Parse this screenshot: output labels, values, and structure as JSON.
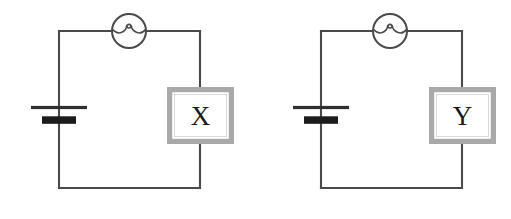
{
  "figure": {
    "background_color": "#ffffff",
    "wire_color": "#4a4a4a",
    "box_border_color": "#a9a9a9",
    "box_fill_color": "#ffffff",
    "label_color": "#1a1a1a",
    "battery_plate_color": "#1c1c1c"
  },
  "circuits": [
    {
      "id": "circuit-left",
      "name": "left-circuit",
      "component_label": "X",
      "component_name": "unknown-component-x",
      "lamp_name": "lamp",
      "battery_name": "battery-cell",
      "loop": {
        "x1": 59,
        "y1": 31,
        "x2": 200,
        "y2": 188
      },
      "lamp": {
        "cx": 129,
        "cy": 31,
        "r": 17
      },
      "battery": {
        "cx": 59,
        "long_plate_y": 107.5,
        "long_plate_half_width": 28,
        "long_plate_thickness": 3.2,
        "short_plate_y": 120,
        "short_plate_half_width": 17,
        "short_plate_thickness": 7.5
      },
      "box": {
        "x": 167,
        "y": 87,
        "w": 67,
        "h": 57
      }
    },
    {
      "id": "circuit-right",
      "name": "right-circuit",
      "component_label": "Y",
      "component_name": "unknown-component-y",
      "lamp_name": "lamp",
      "battery_name": "battery-cell",
      "loop": {
        "x1": 321,
        "y1": 31,
        "x2": 462,
        "y2": 188
      },
      "lamp": {
        "cx": 390,
        "cy": 31,
        "r": 17
      },
      "battery": {
        "cx": 321,
        "long_plate_y": 107.5,
        "long_plate_half_width": 28,
        "long_plate_thickness": 3.2,
        "short_plate_y": 120,
        "short_plate_half_width": 17,
        "short_plate_thickness": 7.5
      },
      "box": {
        "x": 429,
        "y": 87,
        "w": 67,
        "h": 57
      }
    }
  ]
}
